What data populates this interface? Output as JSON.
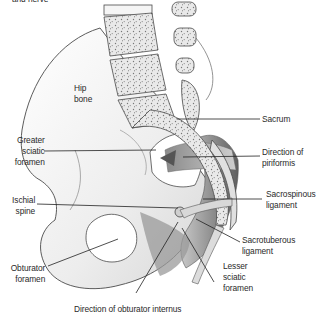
{
  "figure": {
    "type": "anatomical-illustration",
    "truncated_top_label": "and nerve",
    "labels": {
      "hip_bone": [
        "Hip",
        "bone"
      ],
      "greater_sciatic_foramen": [
        "Greater",
        "sciatic",
        "foramen"
      ],
      "ischial_spine": [
        "Ischial",
        "spine"
      ],
      "obturator_foramen": [
        "Obturator",
        "foramen"
      ],
      "direction_obturator_internus": "Direction of obturator internus",
      "sacrum": "Sacrum",
      "direction_piriformis": [
        "Direction of",
        "piriformis"
      ],
      "sacrospinous_ligament": [
        "Sacrospinous",
        "ligament"
      ],
      "sacrotuberous_ligament": [
        "Sacrotuberous",
        "ligament"
      ],
      "lesser_sciatic_foramen": [
        "Lesser",
        "sciatic",
        "foramen"
      ]
    },
    "colors": {
      "outline": "#4a4a4a",
      "bone_fill": "#f2f2f2",
      "shade_dark": "#6e6e6e",
      "shade_mid": "#a9a9a9",
      "leader_line": "#222222",
      "text": "#2a2a2a"
    }
  }
}
